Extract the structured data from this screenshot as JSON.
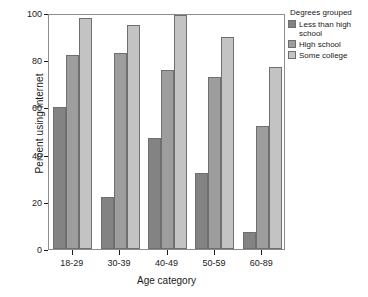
{
  "chart_data": {
    "type": "bar",
    "title": "",
    "xlabel": "Age category",
    "ylabel": "Percent using Internet",
    "categories": [
      "18-29",
      "30-39",
      "40-49",
      "50-59",
      "60-89"
    ],
    "series": [
      {
        "name": "Less than high school",
        "values": [
          60,
          22,
          47,
          32,
          7
        ],
        "color": "#838383"
      },
      {
        "name": "High school",
        "values": [
          82,
          83,
          76,
          73,
          52
        ],
        "color": "#9d9d9d"
      },
      {
        "name": "Some college",
        "values": [
          98,
          95,
          99,
          90,
          77
        ],
        "color": "#c3c3c3"
      }
    ],
    "ylim": [
      0,
      100
    ],
    "yticks": [
      0,
      20,
      40,
      60,
      80,
      100
    ],
    "ytick_labels": [
      "0",
      "20",
      "40",
      "60",
      "80",
      "100"
    ],
    "grid": false,
    "legend_position": "right",
    "legend_title": "Degrees grouped"
  },
  "legend": {
    "title": "Degrees grouped",
    "entries": [
      {
        "label": "Less than high\nschool"
      },
      {
        "label": "High school"
      },
      {
        "label": "Some college"
      }
    ]
  },
  "axes": {
    "x_title": "Age category",
    "y_title": "Percent using Internet"
  }
}
